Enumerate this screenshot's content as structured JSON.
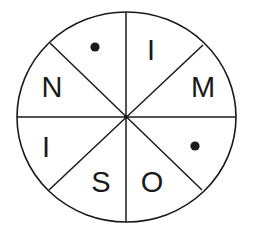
{
  "diagram": {
    "type": "circular-letter-puzzle",
    "colors": {
      "background": "#ffffff",
      "stroke": "#1a1a1a",
      "text": "#1a1a1a"
    },
    "sectors": [
      {
        "position": "top-right-upper",
        "content_type": "letter",
        "label": "I"
      },
      {
        "position": "right-upper",
        "content_type": "letter",
        "label": "M"
      },
      {
        "position": "right-lower",
        "content_type": "dot",
        "label": "•"
      },
      {
        "position": "bottom-right",
        "content_type": "letter",
        "label": "O"
      },
      {
        "position": "bottom-left",
        "content_type": "letter",
        "label": "S"
      },
      {
        "position": "left-lower",
        "content_type": "letter",
        "label": "I"
      },
      {
        "position": "left-upper",
        "content_type": "letter",
        "label": "N"
      },
      {
        "position": "top-left-upper",
        "content_type": "dot",
        "label": "•"
      }
    ]
  }
}
